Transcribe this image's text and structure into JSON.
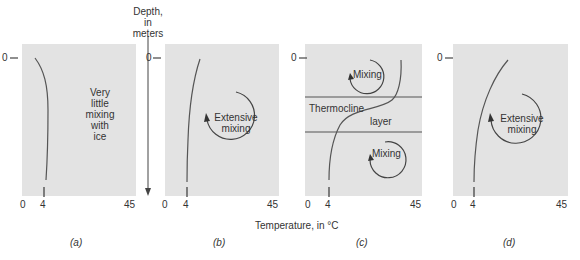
{
  "axis": {
    "depth_label_line1": "Depth,",
    "depth_label_line2": "in",
    "depth_label_line3": "meters",
    "temperature_label": "Temperature, in °C",
    "depth_zero": "0",
    "x_ticks": [
      "0",
      "4",
      "45"
    ]
  },
  "panels": [
    {
      "caption": "(a)",
      "annotation_lines": [
        "Very",
        "little",
        "mixing",
        "with",
        "ice"
      ]
    },
    {
      "caption": "(b)",
      "annotation_lines": [
        "Extensive",
        "mixing"
      ]
    },
    {
      "caption": "(c)",
      "upper_label": "Mixing",
      "thermocline_label": "Thermocline",
      "layer_label": "layer",
      "lower_label": "Mixing"
    },
    {
      "caption": "(d)",
      "annotation_lines": [
        "Extensive",
        "mixing"
      ]
    }
  ],
  "colors": {
    "panel_bg": "#e3e3e3",
    "line": "#555555",
    "text": "#333333"
  }
}
